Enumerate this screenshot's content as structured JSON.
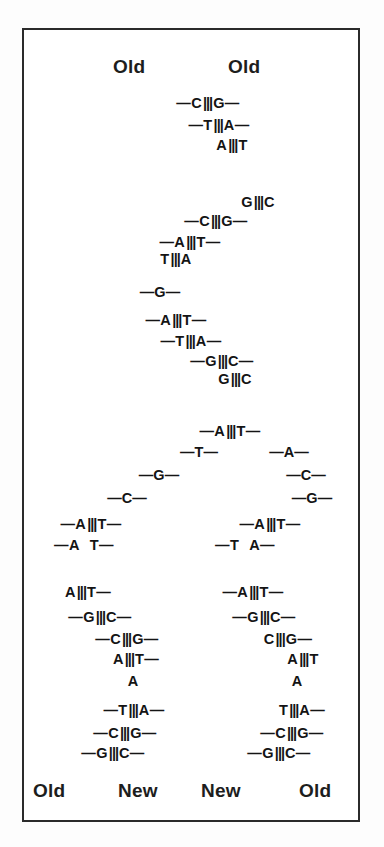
{
  "figure": {
    "frame_color": "#2b2b2b",
    "background": "#ffffff",
    "bond_symbol": "|||",
    "dash": "—"
  },
  "labels": {
    "top": [
      {
        "text": "Old",
        "x": 134,
        "y": 68
      },
      {
        "text": "Old",
        "x": 249,
        "y": 68
      }
    ],
    "bottom": [
      {
        "text": "Old",
        "x": 54,
        "y": 792
      },
      {
        "text": "New",
        "x": 143,
        "y": 792
      },
      {
        "text": "New",
        "x": 226,
        "y": 792
      },
      {
        "text": "Old",
        "x": 322,
        "y": 792
      }
    ]
  },
  "base_pairs": {
    "parent_duplex": [
      {
        "left": "C",
        "right": "G",
        "x": 208,
        "y": 103,
        "lead": "left",
        "trail": "right"
      },
      {
        "left": "T",
        "right": "A",
        "x": 219,
        "y": 125,
        "lead": "left",
        "trail": "right"
      },
      {
        "left": "A",
        "right": "T",
        "x": 232,
        "y": 145,
        "lead": "none",
        "trail": "none"
      },
      {
        "left": "G",
        "right": "C",
        "x": 258,
        "y": 202,
        "lead": "none",
        "trail": "none"
      },
      {
        "left": "C",
        "right": "G",
        "x": 216,
        "y": 221,
        "lead": "left",
        "trail": "right"
      },
      {
        "left": "A",
        "right": "T",
        "x": 190,
        "y": 242,
        "lead": "left",
        "trail": "right"
      },
      {
        "left": "T",
        "right": "A",
        "x": 176,
        "y": 259,
        "lead": "none",
        "trail": "none"
      },
      {
        "left": "A",
        "right": "T",
        "x": 176,
        "y": 320,
        "lead": "left",
        "trail": "right"
      },
      {
        "left": "T",
        "right": "A",
        "x": 191,
        "y": 341,
        "lead": "left",
        "trail": "right"
      },
      {
        "left": "G",
        "right": "C",
        "x": 222,
        "y": 361,
        "lead": "left",
        "trail": "right"
      },
      {
        "left": "G",
        "right": "C",
        "x": 235,
        "y": 379,
        "lead": "none",
        "trail": "none"
      },
      {
        "left": "A",
        "right": "T",
        "x": 230,
        "y": 431,
        "lead": "left",
        "trail": "right"
      }
    ],
    "unpaired_g": {
      "text": "G",
      "x": 160,
      "y": 292
    },
    "fork_unpaired_left": [
      {
        "text": "T",
        "x": 199,
        "y": 452
      },
      {
        "text": "G",
        "x": 159,
        "y": 475
      },
      {
        "text": "C",
        "x": 127,
        "y": 498
      }
    ],
    "fork_unpaired_right": [
      {
        "text": "A",
        "x": 289,
        "y": 452
      },
      {
        "text": "C",
        "x": 306,
        "y": 475
      },
      {
        "text": "G",
        "x": 312,
        "y": 498
      }
    ],
    "daughter_left": [
      {
        "left": "A",
        "right": "T",
        "x": 91,
        "y": 524,
        "lead": "left",
        "trail": "right"
      },
      {
        "left": "A",
        "right": "T",
        "x": 84,
        "y": 545,
        "lead": "left",
        "trail": "right",
        "split": true
      },
      {
        "left": "A",
        "right": "T",
        "x": 88,
        "y": 592,
        "lead": "none",
        "trail": "right"
      },
      {
        "left": "G",
        "right": "C",
        "x": 100,
        "y": 617,
        "lead": "left",
        "trail": "right"
      },
      {
        "left": "C",
        "right": "G",
        "x": 127,
        "y": 639,
        "lead": "left",
        "trail": "right"
      },
      {
        "left": "A",
        "right": "T",
        "x": 136,
        "y": 659,
        "lead": "none",
        "trail": "right"
      },
      {
        "left": "A",
        "right": "",
        "x": 133,
        "y": 681,
        "lead": "none",
        "trail": "none",
        "single": true
      },
      {
        "left": "T",
        "right": "A",
        "x": 134,
        "y": 710,
        "lead": "left",
        "trail": "right"
      },
      {
        "left": "C",
        "right": "G",
        "x": 125,
        "y": 733,
        "lead": "left",
        "trail": "right"
      },
      {
        "left": "G",
        "right": "C",
        "x": 113,
        "y": 753,
        "lead": "left",
        "trail": "right"
      }
    ],
    "daughter_right": [
      {
        "left": "A",
        "right": "T",
        "x": 270,
        "y": 524,
        "lead": "left",
        "trail": "right"
      },
      {
        "left": "T",
        "right": "A",
        "x": 245,
        "y": 545,
        "lead": "left",
        "trail": "right",
        "split": true
      },
      {
        "left": "A",
        "right": "T",
        "x": 253,
        "y": 592,
        "lead": "left",
        "trail": "right"
      },
      {
        "left": "G",
        "right": "C",
        "x": 264,
        "y": 617,
        "lead": "left",
        "trail": "right"
      },
      {
        "left": "C",
        "right": "G",
        "x": 288,
        "y": 639,
        "lead": "none",
        "trail": "right"
      },
      {
        "left": "A",
        "right": "T",
        "x": 303,
        "y": 659,
        "lead": "none",
        "trail": "none"
      },
      {
        "left": "A",
        "right": "",
        "x": 297,
        "y": 681,
        "lead": "none",
        "trail": "none",
        "single": true
      },
      {
        "left": "T",
        "right": "A",
        "x": 302,
        "y": 710,
        "lead": "none",
        "trail": "right"
      },
      {
        "left": "C",
        "right": "G",
        "x": 292,
        "y": 733,
        "lead": "left",
        "trail": "right"
      },
      {
        "left": "G",
        "right": "C",
        "x": 279,
        "y": 753,
        "lead": "left",
        "trail": "right"
      }
    ]
  }
}
